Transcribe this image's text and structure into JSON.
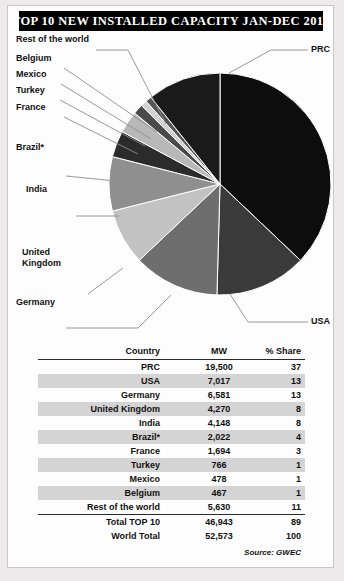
{
  "title": "TOP 10 NEW INSTALLED CAPACITY JAN-DEC 2017",
  "labels": {
    "rest_of_world": "Rest of the world",
    "belgium": "Belgium",
    "mexico": "Mexico",
    "turkey": "Turkey",
    "france": "France",
    "brazil": "Brazil*",
    "india": "India",
    "uk_line1": "United",
    "uk_line2": "Kingdom",
    "germany": "Germany",
    "prc": "PRC",
    "usa": "USA"
  },
  "table": {
    "headers": {
      "country": "Country",
      "mw": "MW",
      "share": "% Share"
    },
    "rows": [
      {
        "country": "PRC",
        "mw": "19,500",
        "share": "37"
      },
      {
        "country": "USA",
        "mw": "7,017",
        "share": "13"
      },
      {
        "country": "Germany",
        "mw": "6,581",
        "share": "13"
      },
      {
        "country": "United Kingdom",
        "mw": "4,270",
        "share": "8"
      },
      {
        "country": "India",
        "mw": "4,148",
        "share": "8"
      },
      {
        "country": "Brazil*",
        "mw": "2,022",
        "share": "4"
      },
      {
        "country": "France",
        "mw": "1,694",
        "share": "3"
      },
      {
        "country": "Turkey",
        "mw": "766",
        "share": "1"
      },
      {
        "country": "Mexico",
        "mw": "478",
        "share": "1"
      },
      {
        "country": "Belgium",
        "mw": "467",
        "share": "1"
      },
      {
        "country": "Rest of the world",
        "mw": "5,630",
        "share": "11"
      }
    ],
    "totals": [
      {
        "country": "Total TOP 10",
        "mw": "46,943",
        "share": "89"
      },
      {
        "country": "World Total",
        "mw": "52,573",
        "share": "100"
      }
    ],
    "source": "Source: GWEC"
  },
  "chart_data": {
    "type": "pie",
    "title": "TOP 10 NEW INSTALLED CAPACITY JAN-DEC 2017",
    "unit": "MW",
    "start_angle_deg": 0,
    "direction": "clockwise",
    "categories": [
      "PRC",
      "USA",
      "Germany",
      "United Kingdom",
      "India",
      "Brazil*",
      "France",
      "Turkey",
      "Mexico",
      "Belgium",
      "Rest of the world"
    ],
    "values": [
      19500,
      7017,
      6581,
      4270,
      4148,
      2022,
      1694,
      766,
      478,
      467,
      5630
    ],
    "percent": [
      37,
      13,
      13,
      8,
      8,
      4,
      3,
      1,
      1,
      1,
      11
    ],
    "colors": [
      "#0d0d0d",
      "#3a3a3a",
      "#6e6e6e",
      "#c2c2c2",
      "#8f8f8f",
      "#2b2b2b",
      "#b8b8b8",
      "#4a4a4a",
      "#d2d2d2",
      "#555555",
      "#1a1a1a"
    ],
    "total": 52573,
    "legend": "leader-lines",
    "grid": false
  },
  "accent": {
    "banner_bg": "#000000",
    "banner_fg": "#ffffff",
    "row_shade": "#d5d4d4",
    "rule": "#2a2a2a"
  }
}
